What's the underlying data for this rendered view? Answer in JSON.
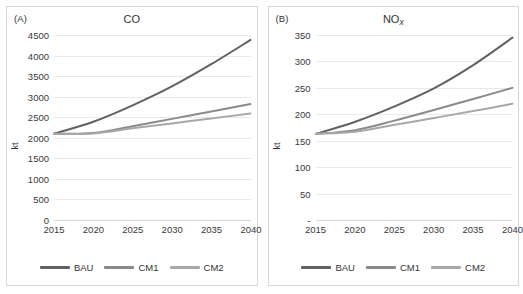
{
  "figure": {
    "panels": [
      {
        "label": "(A)",
        "title": "CO",
        "title_sub": "",
        "ylabel": "kt"
      },
      {
        "label": "(B)",
        "title": "NO",
        "title_sub": "x",
        "ylabel": "kt"
      }
    ],
    "legend": [
      {
        "name": "BAU",
        "color": "#616161"
      },
      {
        "name": "CM1",
        "color": "#8a8a8a"
      },
      {
        "name": "CM2",
        "color": "#a8a8a8"
      }
    ]
  },
  "chart_data": [
    {
      "type": "line",
      "title": "CO",
      "panel": "(A)",
      "xlabel": "",
      "ylabel": "kt",
      "x": [
        2015,
        2020,
        2025,
        2030,
        2035,
        2040
      ],
      "xlim": [
        2015,
        2040
      ],
      "ylim": [
        0,
        4500
      ],
      "yticks": [
        "0",
        "500",
        "1000",
        "1500",
        "2000",
        "2500",
        "3000",
        "3500",
        "4000",
        "4500"
      ],
      "xticks": [
        "2015",
        "2020",
        "2025",
        "2030",
        "2035",
        "2040"
      ],
      "grid": true,
      "legend_position": "bottom",
      "series": [
        {
          "name": "BAU",
          "color": "#616161",
          "values": [
            2100,
            2390,
            2790,
            3250,
            3790,
            4380
          ]
        },
        {
          "name": "CM1",
          "color": "#8a8a8a",
          "values": [
            2100,
            2115,
            2280,
            2460,
            2640,
            2820
          ]
        },
        {
          "name": "CM2",
          "color": "#a8a8a8",
          "values": [
            2100,
            2105,
            2230,
            2350,
            2470,
            2590
          ]
        }
      ]
    },
    {
      "type": "line",
      "title": "NOx",
      "panel": "(B)",
      "xlabel": "",
      "ylabel": "kt",
      "x": [
        2015,
        2020,
        2025,
        2030,
        2035,
        2040
      ],
      "xlim": [
        2015,
        2040
      ],
      "ylim": [
        0,
        350
      ],
      "yticks": [
        "-",
        "50",
        "100",
        "150",
        "200",
        "250",
        "300",
        "350"
      ],
      "xticks": [
        "2015",
        "2020",
        "2025",
        "2030",
        "2035",
        "2040"
      ],
      "grid": true,
      "legend_position": "bottom",
      "series": [
        {
          "name": "BAU",
          "color": "#616161",
          "values": [
            163,
            186,
            215,
            249,
            293,
            345
          ]
        },
        {
          "name": "CM1",
          "color": "#8a8a8a",
          "values": [
            163,
            170,
            188,
            208,
            229,
            250
          ]
        },
        {
          "name": "CM2",
          "color": "#a8a8a8",
          "values": [
            163,
            167,
            180,
            193,
            206,
            220
          ]
        }
      ]
    }
  ]
}
